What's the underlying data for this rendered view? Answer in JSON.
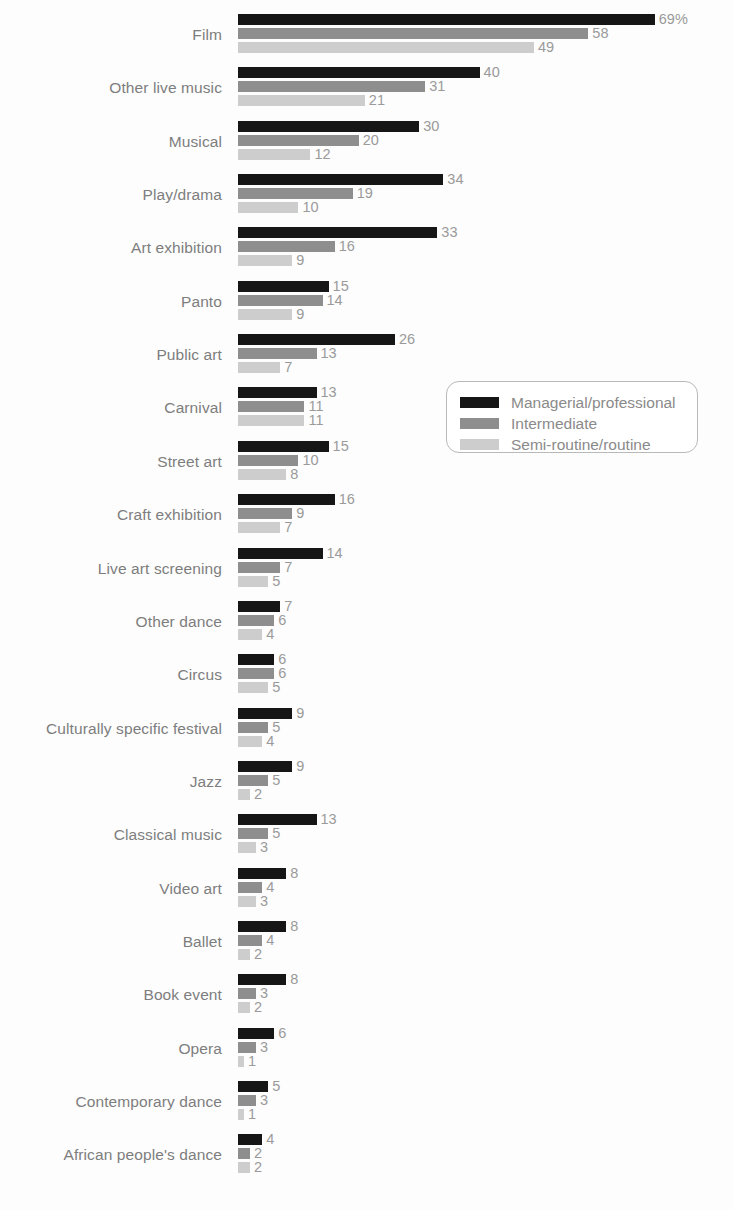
{
  "chart_data": {
    "type": "bar",
    "orientation": "horizontal",
    "title": "",
    "subtitle": "",
    "xlabel": "",
    "ylabel": "",
    "grid": false,
    "axis_visible": false,
    "value_suffix_first": "%",
    "xlim": [
      0,
      69
    ],
    "legend_position": "center-right",
    "colors": {
      "managerial_professional": "#161616",
      "intermediate": "#8e8e8e",
      "semi_routine_routine": "#cdcdcd"
    },
    "categories": [
      "Film",
      "Other live music",
      "Musical",
      "Play/drama",
      "Art exhibition",
      "Panto",
      "Public art",
      "Carnival",
      "Street art",
      "Craft exhibition",
      "Live art screening",
      "Other dance",
      "Circus",
      "Culturally specific festival",
      "Jazz",
      "Classical music",
      "Video art",
      "Ballet",
      "Book event",
      "Opera",
      "Contemporary dance",
      "African people's dance"
    ],
    "series": [
      {
        "name": "Managerial/professional",
        "color": "#161616",
        "values": [
          69,
          40,
          30,
          34,
          33,
          15,
          26,
          13,
          15,
          16,
          14,
          7,
          6,
          9,
          9,
          13,
          8,
          8,
          8,
          6,
          5,
          4
        ],
        "labels": [
          "69%",
          "40",
          "30",
          "34",
          "33",
          "15",
          "26",
          "13",
          "15",
          "16",
          "14",
          "7",
          "6",
          "9",
          "9",
          "13",
          "8",
          "8",
          "8",
          "6",
          "5",
          "4"
        ]
      },
      {
        "name": "Intermediate",
        "color": "#8e8e8e",
        "values": [
          58,
          31,
          20,
          19,
          16,
          14,
          13,
          11,
          10,
          9,
          7,
          6,
          6,
          5,
          5,
          5,
          4,
          4,
          3,
          3,
          3,
          2
        ],
        "labels": [
          "58",
          "31",
          "20",
          "19",
          "16",
          "14",
          "13",
          "11",
          "10",
          "9",
          "7",
          "6",
          "6",
          "5",
          "5",
          "5",
          "4",
          "4",
          "3",
          "3",
          "3",
          "2"
        ]
      },
      {
        "name": "Semi-routine/routine",
        "color": "#cdcdcd",
        "values": [
          49,
          21,
          12,
          10,
          9,
          9,
          7,
          11,
          8,
          7,
          5,
          4,
          5,
          4,
          2,
          3,
          3,
          2,
          2,
          1,
          1,
          2
        ],
        "labels": [
          "49",
          "21",
          "12",
          "10",
          "9",
          "9",
          "7",
          "11",
          "8",
          "7",
          "5",
          "4",
          "5",
          "4",
          "2",
          "3",
          "3",
          "2",
          "2",
          "1",
          "1",
          "2"
        ]
      }
    ]
  },
  "legend": {
    "items": [
      {
        "label": "Managerial/professional",
        "swatch": "s0"
      },
      {
        "label": "Intermediate",
        "swatch": "s1"
      },
      {
        "label": "Semi-routine/routine",
        "swatch": "s2"
      }
    ]
  }
}
